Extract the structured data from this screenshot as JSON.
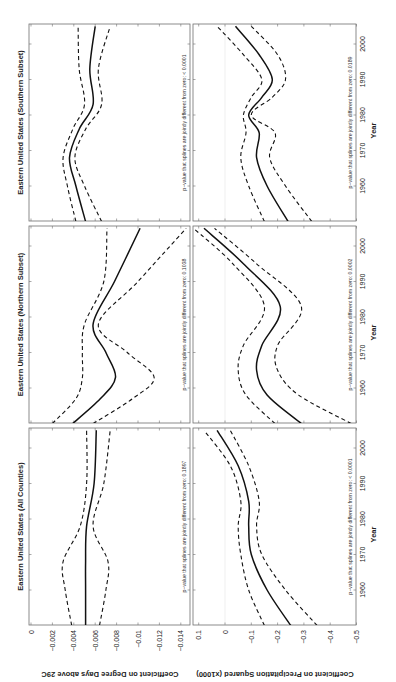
{
  "figure": {
    "orientation": "rotated 90 degrees counterclockwise",
    "x_axis_label": "Year",
    "y_axis_labels": {
      "degree_days": "Coefficient on Degree Days above 29C",
      "precip_sq": "Coefficient on Precipitation Squared (x1000)"
    },
    "year_ticks": [
      "1960",
      "1970",
      "1980",
      "1990",
      "2000"
    ],
    "dd_ticks": [
      "0",
      "−0.002",
      "−0.004",
      "−0.006",
      "−0.008",
      "−0.01",
      "−0.012",
      "−0.014"
    ],
    "precip_ticks": [
      "0.1",
      "0",
      "−0.1",
      "−0.2",
      "−0.3",
      "−0.4",
      "−0.5"
    ],
    "panels": [
      {
        "title": "Eastern United States (All Counties)",
        "dd_pvalue": "p−value that splines are jointly different from zero: 0.1897",
        "precip_pvalue": "p−value that splines are jointly different from zero: < 0.0001"
      },
      {
        "title": "Eastern United States (Northern Subset)",
        "dd_pvalue": "p−value that splines are jointly different from zero: 0.1038",
        "precip_pvalue": "p−value that splines are jointly different from zero: 0.0002"
      },
      {
        "title": "Eastern United States (Southern Subset)",
        "dd_pvalue": "p−value that splines are jointly different from zero: < 0.0001",
        "precip_pvalue": "p−value that splines are jointly different from zero: 0.0189"
      }
    ]
  },
  "chart_data": [
    {
      "type": "line",
      "title": "Eastern United States (All Counties)",
      "xlabel": "Year",
      "ylabel": "Coefficient on Degree Days above 29C",
      "xlim": [
        1950,
        2005
      ],
      "ylim": [
        -0.015,
        0
      ],
      "x": [
        1950,
        1960,
        1968,
        1978,
        1990,
        2005
      ],
      "series": [
        {
          "name": "estimate",
          "style": "solid",
          "values": [
            -0.0051,
            -0.0051,
            -0.0051,
            -0.0052,
            -0.0059,
            -0.0061
          ]
        },
        {
          "name": "upper 95% CI",
          "style": "dashed",
          "values": [
            -0.0038,
            -0.0032,
            -0.003,
            -0.0046,
            -0.0052,
            -0.0052
          ]
        },
        {
          "name": "lower 95% CI",
          "style": "dashed",
          "values": [
            -0.0064,
            -0.007,
            -0.0072,
            -0.0058,
            -0.0068,
            -0.0074
          ]
        }
      ],
      "annotation": "p-value that splines are jointly different from zero: 0.1897"
    },
    {
      "type": "line",
      "title": "Eastern United States (All Counties)",
      "xlabel": "Year",
      "ylabel": "Coefficient on Precipitation Squared (x1000)",
      "xlim": [
        1950,
        2005
      ],
      "ylim": [
        -0.5,
        0.12
      ],
      "x": [
        1950,
        1960,
        1970,
        1978,
        1985,
        1995,
        2005
      ],
      "series": [
        {
          "name": "estimate",
          "style": "solid",
          "values": [
            -0.25,
            -0.16,
            -0.1,
            -0.09,
            -0.09,
            -0.05,
            0.03
          ]
        },
        {
          "name": "upper 95% CI",
          "style": "dashed",
          "values": [
            -0.15,
            -0.09,
            -0.06,
            -0.05,
            -0.06,
            -0.02,
            0.08
          ]
        },
        {
          "name": "lower 95% CI",
          "style": "dashed",
          "values": [
            -0.35,
            -0.23,
            -0.14,
            -0.12,
            -0.13,
            -0.09,
            -0.02
          ]
        }
      ],
      "annotation": "p-value that splines are jointly different from zero: < 0.0001"
    },
    {
      "type": "line",
      "title": "Eastern United States (Northern Subset)",
      "xlabel": "Year",
      "ylabel": "Coefficient on Degree Days above 29C",
      "xlim": [
        1950,
        2005
      ],
      "ylim": [
        -0.015,
        0
      ],
      "x": [
        1950,
        1957,
        1963,
        1970,
        1978,
        1990,
        2005
      ],
      "series": [
        {
          "name": "estimate",
          "style": "solid",
          "values": [
            -0.0039,
            -0.0065,
            -0.0079,
            -0.007,
            -0.0058,
            -0.0078,
            -0.0102
          ]
        },
        {
          "name": "upper 95% CI",
          "style": "dashed",
          "values": [
            -0.002,
            -0.0042,
            -0.0048,
            -0.0048,
            -0.005,
            -0.0068,
            -0.0071
          ]
        },
        {
          "name": "lower 95% CI",
          "style": "dashed",
          "values": [
            -0.0058,
            -0.0095,
            -0.0115,
            -0.009,
            -0.0063,
            -0.01,
            -0.0145
          ]
        }
      ],
      "annotation": "p-value that splines are jointly different from zero: 0.1038"
    },
    {
      "type": "line",
      "title": "Eastern United States (Northern Subset)",
      "xlabel": "Year",
      "ylabel": "Coefficient on Precipitation Squared (x1000)",
      "xlim": [
        1950,
        2005
      ],
      "ylim": [
        -0.5,
        0.12
      ],
      "x": [
        1950,
        1958,
        1965,
        1972,
        1983,
        1995,
        2005
      ],
      "series": [
        {
          "name": "estimate",
          "style": "solid",
          "values": [
            -0.29,
            -0.16,
            -0.12,
            -0.14,
            -0.21,
            -0.07,
            0.08
          ]
        },
        {
          "name": "upper 95% CI",
          "style": "dashed",
          "values": [
            -0.19,
            -0.08,
            -0.05,
            -0.07,
            -0.15,
            -0.03,
            0.12
          ]
        },
        {
          "name": "lower 95% CI",
          "style": "dashed",
          "values": [
            -0.48,
            -0.28,
            -0.2,
            -0.2,
            -0.29,
            -0.12,
            0.04
          ]
        }
      ],
      "annotation": "p-value that splines are jointly different from zero: 0.0002"
    },
    {
      "type": "line",
      "title": "Eastern United States (Southern Subset)",
      "xlabel": "Year",
      "ylabel": "Coefficient on Degree Days above 29C",
      "xlim": [
        1950,
        2005
      ],
      "ylim": [
        -0.015,
        0
      ],
      "x": [
        1950,
        1960,
        1968,
        1976,
        1983,
        1993,
        2005
      ],
      "series": [
        {
          "name": "estimate",
          "style": "solid",
          "values": [
            -0.0051,
            -0.0042,
            -0.0036,
            -0.0045,
            -0.0058,
            -0.0055,
            -0.006
          ]
        },
        {
          "name": "upper 95% CI",
          "style": "dashed",
          "values": [
            -0.0042,
            -0.0034,
            -0.003,
            -0.0039,
            -0.005,
            -0.0045,
            -0.0044
          ]
        },
        {
          "name": "lower 95% CI",
          "style": "dashed",
          "values": [
            -0.0066,
            -0.005,
            -0.0041,
            -0.0051,
            -0.0066,
            -0.0063,
            -0.0074
          ]
        }
      ],
      "annotation": "p-value that splines are jointly different from zero: < 0.0001"
    },
    {
      "type": "line",
      "title": "Eastern United States (Southern Subset)",
      "xlabel": "Year",
      "ylabel": "Coefficient on Precipitation Squared (x1000)",
      "xlim": [
        1950,
        2005
      ],
      "ylim": [
        -0.5,
        0.12
      ],
      "x": [
        1950,
        1960,
        1968,
        1975,
        1980,
        1985,
        1990,
        1997,
        2005
      ],
      "series": [
        {
          "name": "estimate",
          "style": "solid",
          "values": [
            -0.24,
            -0.16,
            -0.12,
            -0.13,
            -0.09,
            -0.14,
            -0.18,
            -0.13,
            -0.04
          ]
        },
        {
          "name": "upper 95% CI",
          "style": "dashed",
          "values": [
            -0.15,
            -0.09,
            -0.06,
            -0.08,
            -0.07,
            -0.1,
            -0.14,
            -0.07,
            0.03
          ]
        },
        {
          "name": "lower 95% CI",
          "style": "dashed",
          "values": [
            -0.33,
            -0.23,
            -0.17,
            -0.19,
            -0.1,
            -0.18,
            -0.23,
            -0.2,
            -0.1
          ]
        }
      ],
      "annotation": "p-value that splines are jointly different from zero: 0.0189"
    }
  ]
}
